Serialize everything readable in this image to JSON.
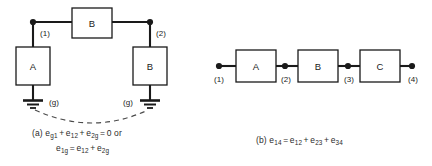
{
  "figure": {
    "background_color": "#ffffff",
    "ink_color": "#1a1a1a",
    "dashed_color": "#4a4a4a"
  },
  "panel_a": {
    "id": "a",
    "blocks": [
      {
        "name": "block-a",
        "label": "A",
        "x": 16,
        "y": 47,
        "w": 34,
        "h": 38
      },
      {
        "name": "block-b-top",
        "label": "B",
        "x": 72,
        "y": 8,
        "w": 40,
        "h": 30
      },
      {
        "name": "block-b-right",
        "label": "B",
        "x": 133,
        "y": 47,
        "w": 34,
        "h": 38
      }
    ],
    "nodes": [
      {
        "name": "node-1",
        "label": "(1)",
        "x": 33,
        "y": 22
      },
      {
        "name": "node-2",
        "label": "(2)",
        "x": 150,
        "y": 22
      }
    ],
    "grounds": [
      {
        "name": "ground-left",
        "label": "(g)",
        "x": 33,
        "y": 100
      },
      {
        "name": "ground-right",
        "label": "(g)",
        "x": 150,
        "y": 100
      }
    ],
    "caption_line1": {
      "prefix": "(a) ",
      "terms": [
        "e",
        "g1",
        " + ",
        "e",
        "12",
        " + ",
        "e",
        "2g"
      ],
      "plain": "(a) e_g1 + e_12 + e_2g = 0  or"
    },
    "caption_line2": {
      "plain": "e_1g = e_12 + e_2g"
    }
  },
  "panel_b": {
    "id": "b",
    "blocks": [
      {
        "name": "block-a",
        "label": "A",
        "x": 236,
        "y": 50,
        "w": 40,
        "h": 32
      },
      {
        "name": "block-b",
        "label": "B",
        "x": 298,
        "y": 50,
        "w": 40,
        "h": 32
      },
      {
        "name": "block-c",
        "label": "C",
        "x": 360,
        "y": 50,
        "w": 40,
        "h": 32
      }
    ],
    "nodes": [
      {
        "name": "node-1",
        "label": "(1)",
        "x": 219,
        "y": 66
      },
      {
        "name": "node-2",
        "label": "(2)",
        "x": 285,
        "y": 66
      },
      {
        "name": "node-3",
        "label": "(3)",
        "x": 348,
        "y": 66
      },
      {
        "name": "node-4",
        "label": "(4)",
        "x": 412,
        "y": 66
      }
    ],
    "caption_line1": {
      "plain": "(b) e_14 = e_12 + e_23 + e_34"
    }
  },
  "symbols": {
    "e": "e",
    "equals": "=",
    "plus": "+",
    "zero": "0",
    "or": "or",
    "label_a": "(a)",
    "label_b": "(b)"
  },
  "subscripts": {
    "g1": "g1",
    "12": "12",
    "2g": "2g",
    "1g": "1g",
    "14": "14",
    "23": "23",
    "34": "34"
  }
}
